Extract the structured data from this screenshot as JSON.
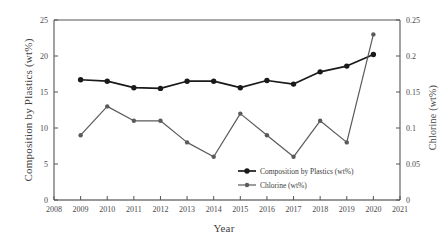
{
  "chart_data": {
    "type": "line",
    "title": "",
    "xlabel": "Year",
    "ylabel": "Composition by Plastics (wt%)",
    "ylabel_right": "Chlorine (wt%)",
    "grid": false,
    "legend_position": "inside-bottom-right",
    "x": [
      2009,
      2010,
      2011,
      2012,
      2013,
      2014,
      2015,
      2016,
      2017,
      2018,
      2019,
      2020
    ],
    "xlim": [
      2008,
      2021
    ],
    "xticks": [
      "2008",
      "2009",
      "2010",
      "2011",
      "2012",
      "2013",
      "2014",
      "2015",
      "2016",
      "2017",
      "2018",
      "2019",
      "2020",
      "2021"
    ],
    "ylim": [
      0,
      25
    ],
    "yticks": [
      "0",
      "5",
      "10",
      "15",
      "20",
      "25"
    ],
    "ylim_right": [
      0,
      0.25
    ],
    "yticks_right": [
      "0",
      "0.05",
      "0.1",
      "0.15",
      "0.2",
      "0.25"
    ],
    "series": [
      {
        "name": "Composition by Plastics (wt%)",
        "axis": "left",
        "color": "#1a1a1a",
        "marker": "circle",
        "values": [
          16.7,
          16.5,
          15.6,
          15.5,
          16.5,
          16.5,
          15.6,
          16.6,
          16.1,
          17.8,
          18.6,
          20.2
        ]
      },
      {
        "name": "Chlorine (wt%)",
        "axis": "right",
        "color": "#5a5a5a",
        "marker": "circle",
        "values": [
          0.09,
          0.13,
          0.11,
          0.11,
          0.08,
          0.06,
          0.12,
          0.09,
          0.06,
          0.11,
          0.08,
          0.23
        ]
      }
    ]
  },
  "legend": {
    "items": [
      {
        "label": "Composition by Plastics (wt%)",
        "color": "#1a1a1a"
      },
      {
        "label": "Chlorine (wt%)",
        "color": "#5a5a5a"
      }
    ]
  },
  "axes": {
    "x_title": "Year",
    "y_left_title": "Composition by Plastics (wt%)",
    "y_right_title": "Chlorine (wt%)"
  }
}
